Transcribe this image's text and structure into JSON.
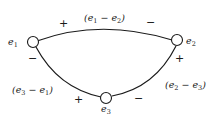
{
  "diagram": {
    "nodes": [
      {
        "id": "e1",
        "base": "e",
        "sub": "1"
      },
      {
        "id": "e2",
        "base": "e",
        "sub": "2"
      },
      {
        "id": "e3",
        "base": "e",
        "sub": "3"
      }
    ],
    "edges": [
      {
        "from": "e1",
        "to": "e2",
        "label": {
          "open": "(",
          "a": "e",
          "asub": "1",
          "op": " − ",
          "b": "e",
          "bsub": "2",
          "close": ")"
        },
        "sign_start": "+",
        "sign_end": "−"
      },
      {
        "from": "e3",
        "to": "e1",
        "label": {
          "open": "(",
          "a": "e",
          "asub": "3",
          "op": " − ",
          "b": "e",
          "bsub": "1",
          "close": ")"
        },
        "sign_start": "+",
        "sign_end": "−"
      },
      {
        "from": "e2",
        "to": "e3",
        "label": {
          "open": "(",
          "a": "e",
          "asub": "2",
          "op": " − ",
          "b": "e",
          "bsub": "3",
          "close": ")"
        },
        "sign_start": "+",
        "sign_end": "−"
      }
    ]
  }
}
